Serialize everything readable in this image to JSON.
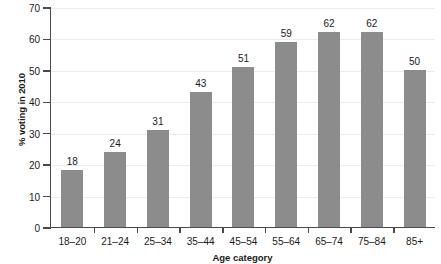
{
  "chart_data": {
    "type": "bar",
    "title": "",
    "xlabel": "Age category",
    "ylabel": "% voting in 2010",
    "categories": [
      "18–20",
      "21–24",
      "25–34",
      "35–44",
      "45–54",
      "55–64",
      "65–74",
      "75–84",
      "85+"
    ],
    "values": [
      18,
      24,
      31,
      43,
      51,
      59,
      62,
      62,
      50
    ],
    "data_labels": [
      "18",
      "24",
      "31",
      "43",
      "51",
      "59",
      "62",
      "62",
      "50"
    ],
    "ylim": [
      0,
      70
    ],
    "yticks": [
      0,
      10,
      20,
      30,
      40,
      50,
      60,
      70
    ],
    "ytick_labels": [
      "0",
      "10",
      "20",
      "30",
      "40",
      "50",
      "60",
      "70"
    ],
    "grid": "horizontal",
    "legend": "none",
    "bar_color": "#8c8c8c",
    "axis_color": "#4a4a4a",
    "gridline_color": "#ececec",
    "background": "#ffffff"
  }
}
